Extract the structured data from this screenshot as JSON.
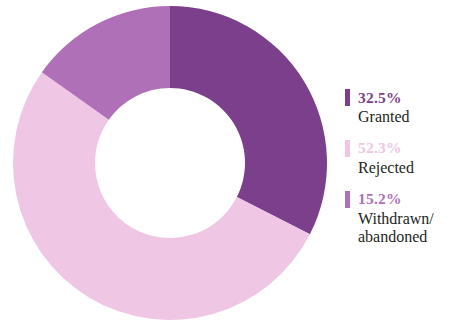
{
  "chart_data": {
    "type": "pie",
    "variant": "donut",
    "title": "",
    "subtitle": "",
    "xlabel": "",
    "ylabel": "",
    "grid": false,
    "legend_position": "right",
    "start_angle_deg": 0,
    "direction": "clockwise",
    "units": "percent",
    "total": 100.0,
    "categories": [
      "Granted",
      "Rejected",
      "Withdrawn/\nabandoned"
    ],
    "values": [
      32.5,
      52.3,
      15.2
    ],
    "value_labels": [
      "32.5%",
      "52.3%",
      "15.2%"
    ],
    "colors": [
      "#7B3F8C",
      "#EFC6E4",
      "#B070B8"
    ],
    "slices": [
      {
        "label": "Granted",
        "value": 32.5,
        "value_label": "32.5%",
        "color": "#7B3F8C",
        "start_deg": 0,
        "end_deg": 117.0
      },
      {
        "label": "Rejected",
        "value": 52.3,
        "value_label": "52.3%",
        "color": "#EFC6E4",
        "start_deg": 117.0,
        "end_deg": 305.28
      },
      {
        "label": "Withdrawn/\nabandoned",
        "value": 15.2,
        "value_label": "15.2%",
        "color": "#B070B8",
        "start_deg": 305.28,
        "end_deg": 360.0
      }
    ]
  },
  "legend": {
    "items": [
      {
        "percent": "32.5%",
        "label": "Granted",
        "color": "#7B3F8C",
        "percent_color": "#7B3F8C"
      },
      {
        "percent": "52.3%",
        "label": "Rejected",
        "color": "#EFC6E4",
        "percent_color": "#EFC6E4"
      },
      {
        "percent": "15.2%",
        "label": "Withdrawn/\nabandoned",
        "color": "#B070B8",
        "percent_color": "#B070B8"
      }
    ]
  }
}
